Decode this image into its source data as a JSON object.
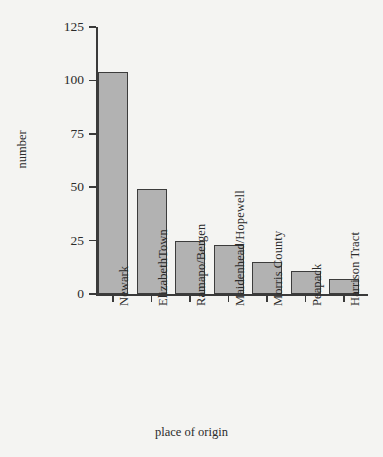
{
  "chart_data": {
    "type": "bar",
    "title": "",
    "xlabel": "place of origin",
    "ylabel": "number",
    "categories": [
      "Newark",
      "ElizabethTown",
      "Ramapo/Bergen",
      "Maidenhead/Hopewell",
      "Morris County",
      "Peapack",
      "Harrison Tract"
    ],
    "values": [
      104,
      49,
      25,
      23,
      15,
      11,
      7
    ],
    "ylim": [
      0,
      125
    ],
    "yticks": [
      0,
      25,
      50,
      75,
      100,
      125
    ],
    "ytick_labels": [
      "0",
      "25",
      "50",
      "75",
      "100",
      "125"
    ],
    "grid": false,
    "legend": false,
    "bar_color": "#b2b2b2",
    "bar_edge_color": "#3c3c3c",
    "axis_color": "#3a3a3a",
    "background_color": "#f4f4f2"
  }
}
